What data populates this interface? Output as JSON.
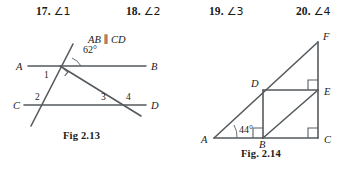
{
  "problems": [
    {
      "number": "17.",
      "angle": "∠1"
    },
    {
      "number": "18.",
      "angle": "∠2"
    },
    {
      "number": "19.",
      "angle": "∠3"
    },
    {
      "number": "20.",
      "angle": "∠4"
    }
  ],
  "figure_left": {
    "caption": "Fig 2.13",
    "parallel_note": "AB ∥ CD",
    "point_labels": {
      "A": "A",
      "B": "B",
      "C": "C",
      "D": "D"
    },
    "angle_labels": {
      "a1": "1",
      "a2": "2",
      "a3": "3",
      "a4": "4"
    },
    "measured_angle": "62°",
    "line_color": "#555a5e"
  },
  "figure_right": {
    "caption": "Fig. 2.14",
    "point_labels": {
      "A": "A",
      "B": "B",
      "C": "C",
      "D": "D",
      "E": "E",
      "F": "F"
    },
    "measured_angle": "44°",
    "line_color": "#555a5e"
  }
}
